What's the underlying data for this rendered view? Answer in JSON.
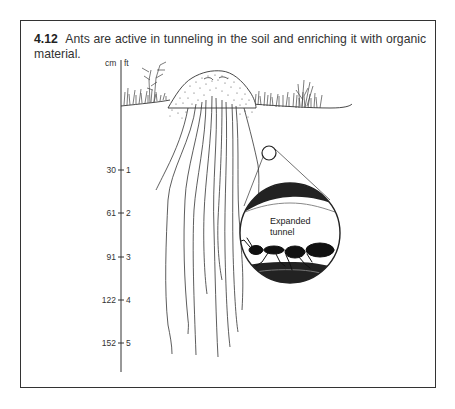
{
  "figure": {
    "number": "4.12",
    "caption": "Ants are active in tunneling in the soil and enriching it with organic material."
  },
  "scale": {
    "unit_left": "cm",
    "unit_right": "ft",
    "ticks": [
      {
        "cm": "30",
        "ft": "1"
      },
      {
        "cm": "61",
        "ft": "2"
      },
      {
        "cm": "91",
        "ft": "3"
      },
      {
        "cm": "122",
        "ft": "4"
      },
      {
        "cm": "152",
        "ft": "5"
      }
    ]
  },
  "inset": {
    "label_line1": "Expanded",
    "label_line2": "tunnel"
  }
}
